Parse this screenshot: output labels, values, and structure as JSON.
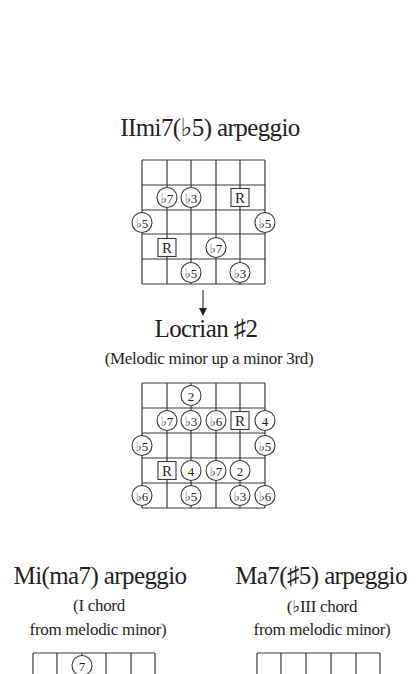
{
  "colors": {
    "ink": "#231f20",
    "lines": "#3a3637",
    "background": "#ffffff"
  },
  "section1": {
    "title": "IImi7(♭5) arpeggio",
    "diagram": {
      "strings_x": [
        142,
        167,
        191,
        216,
        240,
        265
      ],
      "frets_y": [
        160,
        185,
        210,
        234,
        259,
        284
      ],
      "notes": [
        {
          "string": 2,
          "fret": 2,
          "label": "♭7",
          "shape": "circle"
        },
        {
          "string": 3,
          "fret": 2,
          "label": "♭3",
          "shape": "circle"
        },
        {
          "string": 5,
          "fret": 2,
          "label": "R",
          "shape": "box"
        },
        {
          "string": 1,
          "fret": 3,
          "label": "♭5",
          "shape": "circle"
        },
        {
          "string": 6,
          "fret": 3,
          "label": "♭5",
          "shape": "circle"
        },
        {
          "string": 2,
          "fret": 4,
          "label": "R",
          "shape": "box"
        },
        {
          "string": 4,
          "fret": 4,
          "label": "♭7",
          "shape": "circle"
        },
        {
          "string": 3,
          "fret": 5,
          "label": "♭5",
          "shape": "circle"
        },
        {
          "string": 5,
          "fret": 5,
          "label": "♭3",
          "shape": "circle"
        }
      ]
    },
    "arrow": {
      "x": 203,
      "y1": 290,
      "y2": 316,
      "icon": "down-arrow-icon"
    }
  },
  "section2": {
    "title": "Locrian ♯2",
    "subtitle": "(Melodic minor up a minor 3rd)",
    "diagram": {
      "strings_x": [
        142,
        167,
        191,
        216,
        240,
        265
      ],
      "frets_y": [
        383,
        408,
        433,
        458,
        483,
        508
      ],
      "notes": [
        {
          "string": 3,
          "fret": 1,
          "label": "2",
          "shape": "circle"
        },
        {
          "string": 2,
          "fret": 2,
          "label": "♭7",
          "shape": "circle"
        },
        {
          "string": 3,
          "fret": 2,
          "label": "♭3",
          "shape": "circle"
        },
        {
          "string": 4,
          "fret": 2,
          "label": "♭6",
          "shape": "circle"
        },
        {
          "string": 5,
          "fret": 2,
          "label": "R",
          "shape": "box"
        },
        {
          "string": 6,
          "fret": 2,
          "label": "4",
          "shape": "circle"
        },
        {
          "string": 1,
          "fret": 3,
          "label": "♭5",
          "shape": "circle"
        },
        {
          "string": 6,
          "fret": 3,
          "label": "♭5",
          "shape": "circle"
        },
        {
          "string": 2,
          "fret": 4,
          "label": "R",
          "shape": "box"
        },
        {
          "string": 3,
          "fret": 4,
          "label": "4",
          "shape": "circle"
        },
        {
          "string": 4,
          "fret": 4,
          "label": "♭7",
          "shape": "circle"
        },
        {
          "string": 5,
          "fret": 4,
          "label": "2",
          "shape": "circle"
        },
        {
          "string": 1,
          "fret": 5,
          "label": "♭6",
          "shape": "circle"
        },
        {
          "string": 3,
          "fret": 5,
          "label": "♭5",
          "shape": "circle"
        },
        {
          "string": 5,
          "fret": 5,
          "label": "♭3",
          "shape": "circle"
        },
        {
          "string": 6,
          "fret": 5,
          "label": "♭6",
          "shape": "circle"
        }
      ]
    }
  },
  "section3": {
    "title": "Mi(ma7) arpeggio",
    "subtitle_line1": "(I chord",
    "subtitle_line2": "from melodic minor)",
    "diagram": {
      "strings_x": [
        33,
        57,
        82,
        106,
        131,
        155
      ],
      "frets_y": [
        653,
        678
      ],
      "notes": [
        {
          "string": 3,
          "fret": 1,
          "label": "7",
          "shape": "circle"
        }
      ]
    }
  },
  "section4": {
    "title": "Ma7(♯5) arpeggio",
    "subtitle_line1": "(♭III chord",
    "subtitle_line2": "from melodic minor)",
    "diagram": {
      "strings_x": [
        257,
        281,
        306,
        331,
        356,
        380
      ],
      "frets_y": [
        653,
        678
      ],
      "notes": []
    }
  }
}
